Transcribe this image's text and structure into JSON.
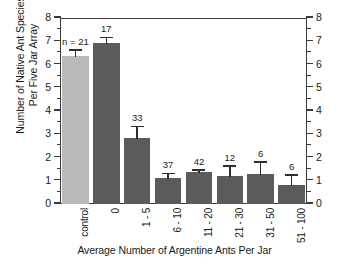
{
  "chart_data": {
    "type": "bar",
    "title": "",
    "xlabel": "Average Number of Argentine Ants Per Jar",
    "ylabel": "Number of Native Ant Species\nPer Five Jar Array",
    "ylabel_right": "Number of Native Ant Species\nPer Five Jar Array",
    "ylim": [
      0,
      8
    ],
    "ytick_labels": [
      "0",
      "1",
      "2",
      "3",
      "4",
      "5",
      "6",
      "7",
      "8"
    ],
    "ytick_values": [
      0,
      1,
      2,
      3,
      4,
      5,
      6,
      7,
      8
    ],
    "yminor_step": 0.5,
    "grid": false,
    "legend": "none",
    "dual_y_axis": true,
    "categories": [
      "control",
      "0",
      "1 - 5",
      "6 - 10",
      "11 - 20",
      "21 - 30",
      "31 - 50",
      "51 - 100"
    ],
    "values": [
      6.38,
      6.92,
      2.83,
      1.11,
      1.38,
      1.22,
      1.3,
      0.83
    ],
    "errors_upper": [
      0.26,
      0.26,
      0.52,
      0.22,
      0.1,
      0.43,
      0.52,
      0.43
    ],
    "sample_size_labels": [
      "n = 21",
      "17",
      "33",
      "37",
      "42",
      "12",
      "6",
      "6"
    ],
    "bar_colors": [
      "#b9b9b9",
      "#5b5b5b",
      "#5b5b5b",
      "#5b5b5b",
      "#5b5b5b",
      "#5b5b5b",
      "#5b5b5b",
      "#5b5b5b"
    ],
    "axis_color": "#3b3b3b",
    "error_bar_color": "#2e2e2e"
  }
}
